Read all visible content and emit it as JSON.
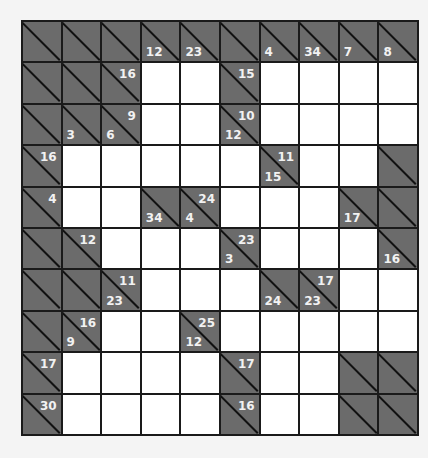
{
  "puzzle": {
    "type": "kakuro",
    "rows": 10,
    "cols": 10,
    "colors": {
      "block": "#6b6b6b",
      "cell": "#ffffff",
      "line": "#1a1a1a",
      "clue_text": "#f2f2f2"
    },
    "grid": [
      [
        {
          "b": 1
        },
        {
          "b": 1
        },
        {
          "b": 1
        },
        {
          "b": 1,
          "d": "12"
        },
        {
          "b": 1,
          "d": "23"
        },
        {
          "b": 1
        },
        {
          "b": 1,
          "d": "4"
        },
        {
          "b": 1,
          "d": "34"
        },
        {
          "b": 1,
          "d": "7"
        },
        {
          "b": 1,
          "d": "8"
        }
      ],
      [
        {
          "b": 1
        },
        {
          "b": 1
        },
        {
          "b": 1,
          "r": "16"
        },
        {
          "b": 0
        },
        {
          "b": 0
        },
        {
          "b": 1,
          "r": "15"
        },
        {
          "b": 0
        },
        {
          "b": 0
        },
        {
          "b": 0
        },
        {
          "b": 0
        }
      ],
      [
        {
          "b": 1
        },
        {
          "b": 1,
          "d": "3"
        },
        {
          "b": 1,
          "r": "9",
          "d": "6"
        },
        {
          "b": 0
        },
        {
          "b": 0
        },
        {
          "b": 1,
          "r": "10",
          "d": "12"
        },
        {
          "b": 0
        },
        {
          "b": 0
        },
        {
          "b": 0
        },
        {
          "b": 0
        }
      ],
      [
        {
          "b": 1,
          "r": "16"
        },
        {
          "b": 0
        },
        {
          "b": 0
        },
        {
          "b": 0
        },
        {
          "b": 0
        },
        {
          "b": 0
        },
        {
          "b": 1,
          "r": "11",
          "d": "15"
        },
        {
          "b": 0
        },
        {
          "b": 0
        },
        {
          "b": 1
        }
      ],
      [
        {
          "b": 1,
          "r": "4"
        },
        {
          "b": 0
        },
        {
          "b": 0
        },
        {
          "b": 1,
          "d": "34"
        },
        {
          "b": 1,
          "r": "24",
          "d": "4"
        },
        {
          "b": 0
        },
        {
          "b": 0
        },
        {
          "b": 0
        },
        {
          "b": 1,
          "d": "17"
        },
        {
          "b": 1
        }
      ],
      [
        {
          "b": 1
        },
        {
          "b": 1,
          "r": "12"
        },
        {
          "b": 0
        },
        {
          "b": 0
        },
        {
          "b": 0
        },
        {
          "b": 1,
          "r": "23",
          "d": "3"
        },
        {
          "b": 0
        },
        {
          "b": 0
        },
        {
          "b": 0
        },
        {
          "b": 1,
          "d": "16"
        }
      ],
      [
        {
          "b": 1
        },
        {
          "b": 1
        },
        {
          "b": 1,
          "r": "11",
          "d": "23"
        },
        {
          "b": 0
        },
        {
          "b": 0
        },
        {
          "b": 0
        },
        {
          "b": 1,
          "d": "24"
        },
        {
          "b": 1,
          "r": "17",
          "d": "23"
        },
        {
          "b": 0
        },
        {
          "b": 0
        }
      ],
      [
        {
          "b": 1
        },
        {
          "b": 1,
          "r": "16",
          "d": "9"
        },
        {
          "b": 0
        },
        {
          "b": 0
        },
        {
          "b": 1,
          "r": "25",
          "d": "12"
        },
        {
          "b": 0
        },
        {
          "b": 0
        },
        {
          "b": 0
        },
        {
          "b": 0
        },
        {
          "b": 0
        }
      ],
      [
        {
          "b": 1,
          "r": "17"
        },
        {
          "b": 0
        },
        {
          "b": 0
        },
        {
          "b": 0
        },
        {
          "b": 0
        },
        {
          "b": 1,
          "r": "17"
        },
        {
          "b": 0
        },
        {
          "b": 0
        },
        {
          "b": 1
        },
        {
          "b": 1
        }
      ],
      [
        {
          "b": 1,
          "r": "30"
        },
        {
          "b": 0
        },
        {
          "b": 0
        },
        {
          "b": 0
        },
        {
          "b": 0
        },
        {
          "b": 1,
          "r": "16"
        },
        {
          "b": 0
        },
        {
          "b": 0
        },
        {
          "b": 1
        },
        {
          "b": 1
        }
      ]
    ]
  }
}
